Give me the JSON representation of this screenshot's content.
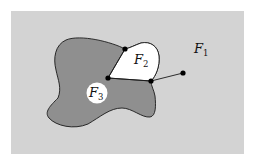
{
  "diagram": {
    "type": "planar-graph-faces",
    "colors": {
      "background_outer": "#ffffff",
      "face_f1_fill": "#d3d3d3",
      "face_dark_fill": "#8f8f8f",
      "face_f2_fill": "#ffffff",
      "face_f3_fill": "#ffffff",
      "edge_color": "#1a1a1a",
      "vertex_color": "#000000"
    },
    "faces": [
      {
        "id": "F1",
        "letter": "F",
        "subscript": "1"
      },
      {
        "id": "F2",
        "letter": "F",
        "subscript": "2"
      },
      {
        "id": "F3",
        "letter": "F",
        "subscript": "3"
      }
    ],
    "vertices": [
      {
        "id": "v-top",
        "x": 125,
        "y": 49
      },
      {
        "id": "v-left",
        "x": 108,
        "y": 78
      },
      {
        "id": "v-right",
        "x": 151,
        "y": 81
      },
      {
        "id": "v-external",
        "x": 183,
        "y": 73
      }
    ]
  }
}
